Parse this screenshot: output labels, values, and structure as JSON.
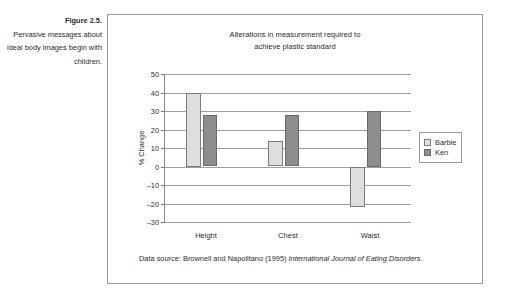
{
  "caption": {
    "figure_number": "Figure 2.5.",
    "text": "Pervasive messages about ideal body images begin with children."
  },
  "chart_title_line1": "Alterations in measurement required to",
  "chart_title_line2": "achieve plastic standard",
  "legend": {
    "items": [
      {
        "label": "Barbie",
        "color": "#dedede"
      },
      {
        "label": "Ken",
        "color": "#8d8d8d"
      }
    ]
  },
  "source": {
    "prefix": "Data source: Brownell and Napolitano (1995) ",
    "journal": "International Journal of Eating Disorders",
    "suffix": "."
  },
  "axis": {
    "y_title": "% Change",
    "ticks": [
      "50",
      "40",
      "30",
      "20",
      "10",
      "0",
      "-10",
      "-20",
      "-30"
    ]
  },
  "chart_data": {
    "type": "bar",
    "title": "Alterations in measurement required to achieve plastic standard",
    "xlabel": "",
    "ylabel": "% Change",
    "categories": [
      "Height",
      "Chest",
      "Waist"
    ],
    "series": [
      {
        "name": "Barbie",
        "color": "#dedede",
        "values": [
          40,
          14,
          -22
        ]
      },
      {
        "name": "Ken",
        "color": "#8d8d8d",
        "values": [
          28,
          28,
          30
        ]
      }
    ],
    "ylim": [
      -30,
      50
    ],
    "ytick_step": 10,
    "grid": true,
    "legend_position": "right",
    "annotation": "Data source: Brownell and Napolitano (1995) International Journal of Eating Disorders."
  }
}
